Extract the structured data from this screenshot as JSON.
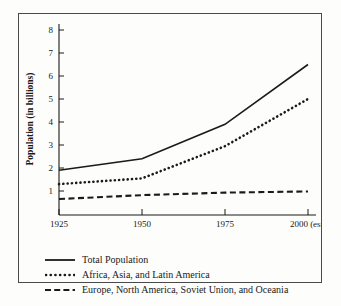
{
  "chart_data": {
    "type": "line",
    "title": "",
    "subtitle": "",
    "xlabel": "",
    "ylabel": "Population (in billions)",
    "x": [
      1925,
      1950,
      1975,
      2000
    ],
    "xtick_labels": [
      "1925",
      "1950",
      "1975",
      "2000 (est)"
    ],
    "ytick_labels": [
      "1",
      "2",
      "3",
      "4",
      "5",
      "6",
      "7",
      "8"
    ],
    "ytick_values": [
      1,
      2,
      3,
      4,
      5,
      6,
      7,
      8
    ],
    "xlim": [
      1925,
      2000
    ],
    "ylim": [
      0,
      8
    ],
    "grid": false,
    "legend_position": "below-plot",
    "series": [
      {
        "name": "Total Population",
        "style": "solid",
        "values": [
          1.9,
          2.4,
          3.9,
          6.5
        ]
      },
      {
        "name": "Africa, Asia, and Latin America",
        "style": "dotted",
        "values": [
          1.3,
          1.55,
          2.95,
          5.0
        ]
      },
      {
        "name": "Europe, North America, Soviet Union, and Oceania",
        "style": "dashed",
        "values": [
          0.65,
          0.82,
          0.93,
          0.98
        ]
      }
    ]
  },
  "axes": {
    "y_title": "Population (in billions)",
    "y_ticks": [
      "1",
      "2",
      "3",
      "4",
      "5",
      "6",
      "7",
      "8"
    ],
    "x_ticks": [
      "1925",
      "1950",
      "1975",
      "2000 (est)"
    ]
  },
  "legend": {
    "entries": [
      {
        "label": "Total Population",
        "marker": "solid-line-marker"
      },
      {
        "label": "Africa, Asia, and Latin America",
        "marker": "dotted-line-marker"
      },
      {
        "label": "Europe, North America, Soviet Union, and Oceania",
        "marker": "dashed-line-marker"
      }
    ]
  },
  "colors": {
    "ink": "#1a1a1a",
    "frame": "#4a4a4a",
    "background": "#fdfdfb"
  }
}
